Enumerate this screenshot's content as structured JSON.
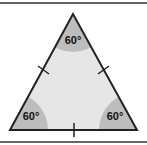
{
  "diagram": {
    "angles": [
      {
        "position": "top",
        "label": "60°"
      },
      {
        "position": "bottom-left",
        "label": "60°"
      },
      {
        "position": "bottom-right",
        "label": "60°"
      }
    ],
    "colors": {
      "fill": "#e6e6e6",
      "angle_fill": "#bdbdbd",
      "stroke": "#222222",
      "border": "#333333"
    }
  }
}
